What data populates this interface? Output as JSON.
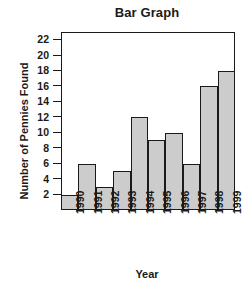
{
  "chart_data": {
    "type": "bar",
    "title": "Bar Graph",
    "xlabel": "Year",
    "ylabel": "Number of Pennies Found",
    "categories": [
      "1990",
      "1991",
      "1992",
      "1993",
      "1994",
      "1995",
      "1996",
      "1997",
      "1998",
      "1999"
    ],
    "values": [
      2,
      6,
      3,
      5,
      12,
      9,
      10,
      6,
      16,
      18
    ],
    "ylim": [
      0,
      23
    ],
    "ytick_values": [
      2,
      4,
      6,
      8,
      10,
      12,
      14,
      16,
      18,
      20,
      22
    ],
    "ytick_labels": [
      "2",
      "4",
      "6",
      "8",
      "10",
      "12",
      "14",
      "16",
      "18",
      "20",
      "22"
    ],
    "grid": false,
    "legend": false,
    "bar_fill_color": "#cccccc",
    "bar_edge_color": "#1a1a1a",
    "axis_color": "#1a1a1a",
    "background_color": "#ffffff"
  }
}
